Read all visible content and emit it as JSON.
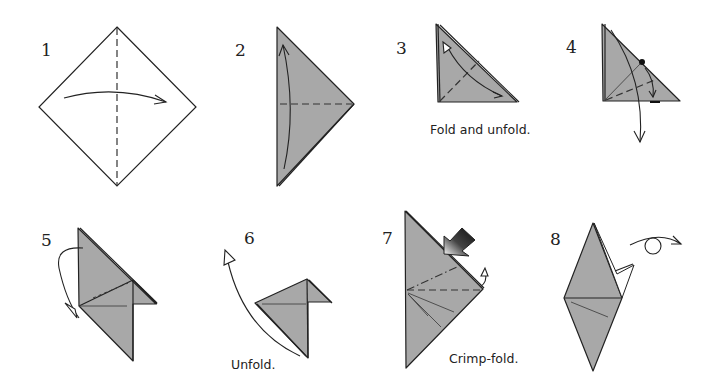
{
  "diagram": {
    "type": "origami-instructions",
    "colors": {
      "paper_colored": "#a8a8a8",
      "paper_white": "#ffffff",
      "line": "#222222",
      "push_arrow_dark": "#111111",
      "push_arrow_light": "#ffffff"
    },
    "steps": [
      {
        "number": "1",
        "caption": "",
        "action": "valley-fold-in-half"
      },
      {
        "number": "2",
        "caption": "",
        "action": "fold-and-unfold-horizontal"
      },
      {
        "number": "3",
        "caption": "Fold and unfold.",
        "action": "fold-and-unfold-diagonal"
      },
      {
        "number": "4",
        "caption": "",
        "action": "pull-layer-down"
      },
      {
        "number": "5",
        "caption": "",
        "action": "turn-over"
      },
      {
        "number": "6",
        "caption": "Unfold.",
        "action": "unfold"
      },
      {
        "number": "7",
        "caption": "Crimp-fold.",
        "action": "crimp-fold"
      },
      {
        "number": "8",
        "caption": "",
        "action": "turn-over"
      }
    ]
  }
}
